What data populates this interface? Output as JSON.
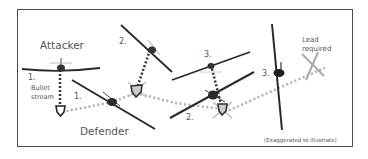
{
  "diagram": {
    "labels": {
      "attacker": "Attacker",
      "defender": "Defender",
      "bullet_stream": [
        "Bullet",
        "stream"
      ],
      "lead_required": [
        "Lead",
        "required"
      ],
      "footnote": "(Exaggerated to illustrate)"
    },
    "steps": {
      "attacker_1": "1.",
      "defender_1": "1.",
      "attacker_2": "2.",
      "defender_2": "2.",
      "attacker_3": "3.",
      "defender_3": "3."
    },
    "colors": {
      "frame": "#4a4a4a",
      "aircraft": "#2a2a2a",
      "ghost_aircraft": "#aaaaaa",
      "defender_path": "#b0b0b0",
      "bullet_stream": "#333333",
      "text": "#555555"
    }
  }
}
